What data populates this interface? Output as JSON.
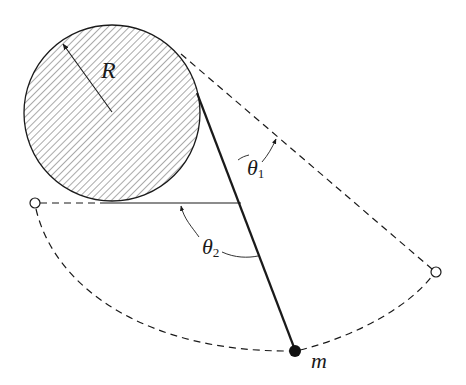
{
  "diagram": {
    "type": "pendulum-wrapping-around-cylinder",
    "colors": {
      "ink": "#1a1a1a",
      "hatch": "#555555",
      "background": "#ffffff"
    },
    "cylinder": {
      "label": "R",
      "center": [
        112,
        113
      ],
      "radius": 88
    },
    "mass": {
      "label": "m",
      "position": [
        295,
        351
      ]
    },
    "pivots": [
      {
        "name": "left-extreme",
        "position": [
          35,
          203
        ]
      },
      {
        "name": "right-extreme",
        "position": [
          436,
          272
        ]
      }
    ],
    "angles": [
      {
        "name": "theta1",
        "symbol": "θ",
        "subscript": "1"
      },
      {
        "name": "theta2",
        "symbol": "θ",
        "subscript": "2"
      }
    ]
  },
  "labels": {
    "radius": "R",
    "mass": "m",
    "theta1_symbol": "θ",
    "theta1_sub": "1",
    "theta2_symbol": "θ",
    "theta2_sub": "2"
  }
}
